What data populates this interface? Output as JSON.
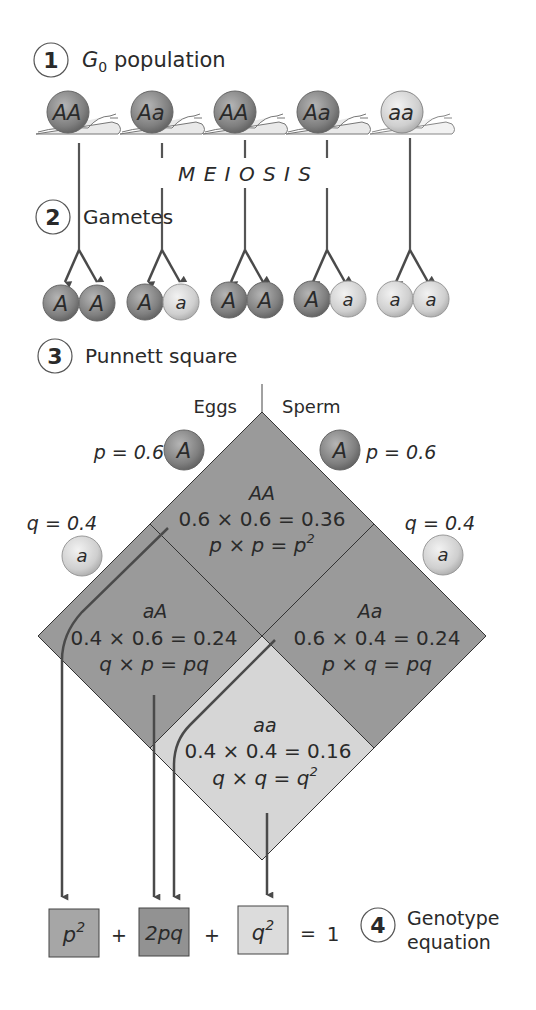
{
  "steps": [
    {
      "number": "1",
      "label": "G",
      "label_sub": "0",
      "label_rest": " population"
    },
    {
      "number": "2",
      "label": "Gametes"
    },
    {
      "number": "3",
      "label": "Punnett square"
    },
    {
      "number": "4",
      "label_line1": "Genotype",
      "label_line2": "equation"
    }
  ],
  "process_label": "M E I O S I S",
  "population": [
    {
      "genotype": "AA",
      "shade": "dark"
    },
    {
      "genotype": "Aa",
      "shade": "dark"
    },
    {
      "genotype": "AA",
      "shade": "dark"
    },
    {
      "genotype": "Aa",
      "shade": "dark"
    },
    {
      "genotype": "aa",
      "shade": "light"
    }
  ],
  "gametes": [
    [
      "A",
      "A"
    ],
    [
      "A",
      "a"
    ],
    [
      "A",
      "A"
    ],
    [
      "A",
      "a"
    ],
    [
      "a",
      "a"
    ]
  ],
  "punnett": {
    "eggs_label": "Eggs",
    "sperm_label": "Sperm",
    "eggs_A_freq": "p = 0.6",
    "eggs_a_freq": "q = 0.4",
    "sperm_A_freq": "p = 0.6",
    "sperm_a_freq": "q = 0.4",
    "allele_A": "A",
    "allele_a": "a",
    "cells": {
      "AA": {
        "genotype": "AA",
        "calc": "0.6 × 0.6 = 0.36",
        "formula": "p × p = p",
        "formula_sup": "2"
      },
      "aA": {
        "genotype": "aA",
        "calc": "0.4 × 0.6 = 0.24",
        "formula": "q × p = pq",
        "formula_sup": ""
      },
      "Aa": {
        "genotype": "Aa",
        "calc": "0.6 × 0.4 = 0.24",
        "formula": "p × q = pq",
        "formula_sup": ""
      },
      "aa": {
        "genotype": "aa",
        "calc": "0.4 × 0.4 = 0.16",
        "formula": "q × q = q",
        "formula_sup": "2"
      }
    }
  },
  "equation": {
    "term1": "p",
    "term1_sup": "2",
    "plus1": "+",
    "term2": "2pq",
    "plus2": "+",
    "term3": "q",
    "term3_sup": "2",
    "equals": "=",
    "result": "1"
  },
  "colors": {
    "dark": "#8a8a8a",
    "medium": "#a3a3a3",
    "light": "#d6d6d6",
    "stroke": "#3a3a3a",
    "arrow": "#4a4a4a"
  }
}
